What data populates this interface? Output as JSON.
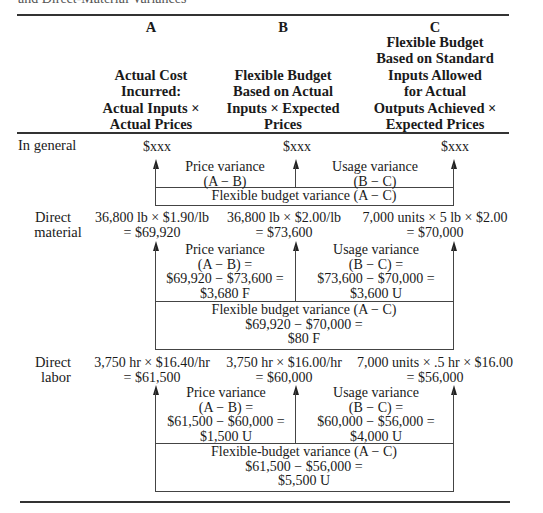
{
  "caption": "and Direct-Material Variances",
  "columns": [
    {
      "letter": "A",
      "lines": [
        "Actual Cost",
        "Incurred:",
        "Actual Inputs ×",
        "Actual Prices"
      ]
    },
    {
      "letter": "B",
      "lines": [
        "Flexible Budget",
        "Based on Actual",
        "Inputs × Expected",
        "Prices"
      ]
    },
    {
      "letter": "C",
      "lines": [
        "Flexible Budget",
        "Based on Standard",
        "Inputs Allowed",
        "for Actual",
        "Outputs Achieved ×",
        "Expected Prices"
      ]
    }
  ],
  "general": {
    "label": "In general",
    "a": "$xxx",
    "b": "$xxx",
    "c": "$xxx",
    "price_variance": [
      "Price variance",
      "(A − B)"
    ],
    "usage_variance": [
      "Usage variance",
      "(B − C)"
    ],
    "flexible_variance": [
      "Flexible budget variance (A − C)"
    ]
  },
  "material": {
    "label": [
      "Direct",
      "material"
    ],
    "a": [
      "36,800 lb × $1.90/lb",
      "= $69,920"
    ],
    "b": [
      "36,800 lb × $2.00/lb",
      "= $73,600"
    ],
    "c": [
      "7,000 units × 5 lb × $2.00",
      "= $70,000"
    ],
    "price_variance": [
      "Price variance",
      "(A − B) =",
      "$69,920 − $73,600 =",
      "$3,680 F"
    ],
    "usage_variance": [
      "Usage variance",
      "(B − C) =",
      "$73,600 − $70,000 =",
      "$3,600 U"
    ],
    "flexible_variance": [
      "Flexible budget variance (A − C)",
      "$69,920 − $70,000 =",
      "$80 F"
    ]
  },
  "labor": {
    "label": [
      "Direct",
      "labor"
    ],
    "a": [
      "3,750 hr × $16.40/hr",
      "= $61,500"
    ],
    "b": [
      "3,750 hr × $16.00/hr",
      "= $60,000"
    ],
    "c": [
      "7,000 units × .5 hr × $16.00",
      "= $56,000"
    ],
    "price_variance": [
      "Price variance",
      "(A − B) =",
      "$61,500 − $60,000 =",
      "$1,500 U"
    ],
    "usage_variance": [
      "Usage variance",
      "(B − C) =",
      "$60,000 − $56,000 =",
      "$4,000 U"
    ],
    "flexible_variance": [
      "Flexible-budget variance (A − C)",
      "$61,500 − $56,000 =",
      "$5,500 U"
    ]
  }
}
